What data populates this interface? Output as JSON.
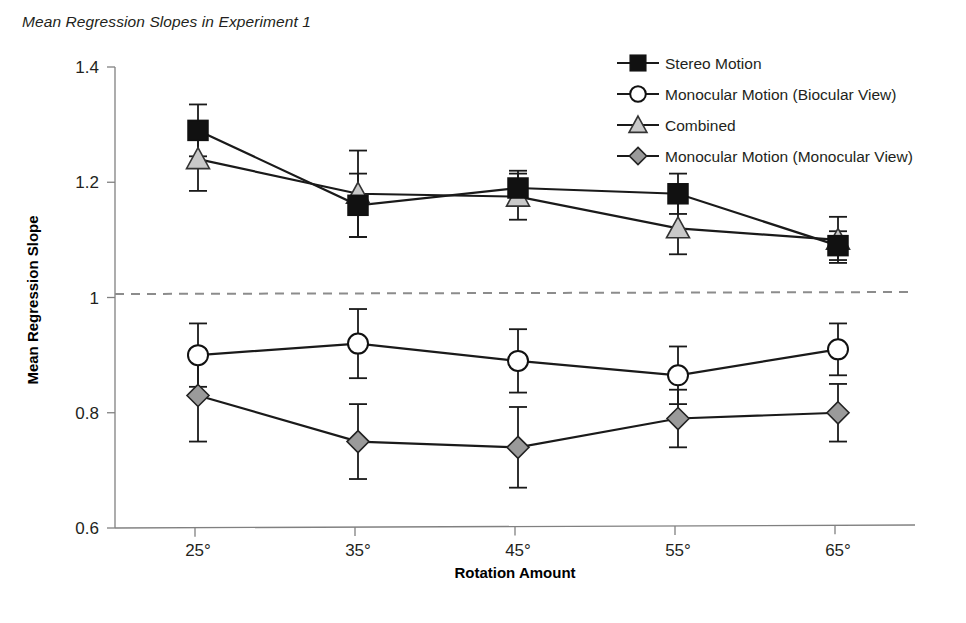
{
  "chart_data": {
    "type": "line",
    "title": "Mean Regression Slopes in Experiment 1",
    "xlabel": "Rotation Amount",
    "ylabel": "Mean Regression Slope",
    "categories": [
      "25°",
      "35°",
      "45°",
      "55°",
      "65°"
    ],
    "x_tick_labels": [
      "25°",
      "35°",
      "45°",
      "55°",
      "65°"
    ],
    "y_tick_labels": [
      "0.6",
      "0.8",
      "1",
      "1.2",
      "1.4"
    ],
    "y_tick_values": [
      0.6,
      0.8,
      1.0,
      1.2,
      1.4
    ],
    "ylim": [
      0.6,
      1.4
    ],
    "grid": false,
    "legend_position": "top-right",
    "reference_line": {
      "value": 1.0,
      "style": "dashed",
      "color": "#8c8c8c"
    },
    "series": [
      {
        "name": "Stereo Motion",
        "marker": "filled-square",
        "color": "#111111",
        "values": [
          1.29,
          1.16,
          1.19,
          1.18,
          1.09
        ],
        "errors": [
          0.045,
          0.055,
          0.03,
          0.035,
          0.025
        ]
      },
      {
        "name": "Monocular Motion (Biocular View)",
        "marker": "open-circle",
        "color": "#ffffff",
        "values": [
          0.9,
          0.92,
          0.89,
          0.865,
          0.91
        ],
        "errors": [
          0.055,
          0.06,
          0.055,
          0.05,
          0.045
        ]
      },
      {
        "name": "Combined",
        "marker": "gray-triangle",
        "color": "#c9c9c9",
        "values": [
          1.24,
          1.18,
          1.175,
          1.12,
          1.1
        ],
        "errors": [
          0.055,
          0.075,
          0.04,
          0.045,
          0.04
        ]
      },
      {
        "name": "Monocular Motion (Monocular View)",
        "marker": "gray-diamond",
        "color": "#9a9a9a",
        "values": [
          0.83,
          0.75,
          0.74,
          0.79,
          0.8
        ],
        "errors": [
          0.08,
          0.065,
          0.07,
          0.05,
          0.05
        ]
      }
    ]
  },
  "legend": {
    "items": [
      {
        "label": "Stereo Motion",
        "marker": "filled-square"
      },
      {
        "label": "Monocular Motion (Biocular View)",
        "marker": "open-circle"
      },
      {
        "label": "Combined",
        "marker": "gray-triangle"
      },
      {
        "label": "Monocular Motion (Monocular View)",
        "marker": "gray-diamond"
      }
    ]
  }
}
